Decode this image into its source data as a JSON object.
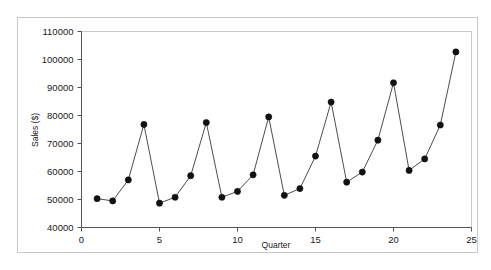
{
  "chart_data": {
    "type": "line",
    "title": "",
    "xlabel": "Quarter",
    "ylabel": "Sales ($)",
    "xlim": [
      0,
      25
    ],
    "ylim": [
      40000,
      110000
    ],
    "xticks": [
      0,
      5,
      10,
      15,
      20,
      25
    ],
    "xtick_labels": [
      "0",
      "5",
      "10",
      "15",
      "20",
      "25"
    ],
    "yticks": [
      40000,
      50000,
      60000,
      70000,
      80000,
      90000,
      100000,
      110000
    ],
    "ytick_labels": [
      "40000",
      "50000",
      "60000",
      "70000",
      "80000",
      "90000",
      "100000",
      "110000"
    ],
    "grid": false,
    "legend": false,
    "legend_position": "none",
    "marker": "filled-circle",
    "marker_color": "#111111",
    "line_color": "#4d4d4d",
    "x": [
      1,
      2,
      3,
      4,
      5,
      6,
      7,
      8,
      9,
      10,
      11,
      12,
      13,
      14,
      15,
      16,
      17,
      18,
      19,
      20,
      21,
      22,
      23,
      24
    ],
    "values": [
      50300,
      49500,
      57000,
      76800,
      48700,
      50800,
      58500,
      77500,
      50800,
      52900,
      58800,
      79500,
      51500,
      53900,
      65500,
      84800,
      56200,
      59800,
      71200,
      91700,
      60400,
      64500,
      76600,
      102700
    ],
    "series": [
      {
        "name": "Sales ($)",
        "values": [
          50300,
          49500,
          57000,
          76800,
          48700,
          50800,
          58500,
          77500,
          50800,
          52900,
          58800,
          79500,
          51500,
          53900,
          65500,
          84800,
          56200,
          59800,
          71200,
          91700,
          60400,
          64500,
          76600,
          102700
        ]
      }
    ]
  },
  "figure": {
    "background_color": "#ffffff",
    "frame_color": "#c9c9c9",
    "axis_color": "#555555"
  }
}
